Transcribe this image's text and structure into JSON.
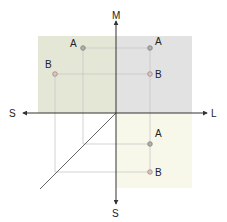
{
  "axes": {
    "up": "M",
    "left": "S",
    "right": "L",
    "down": "S"
  },
  "points": {
    "upper_left": {
      "a": "A",
      "b": "B"
    },
    "upper_right": {
      "a": "A",
      "b": "B"
    },
    "lower_right": {
      "a": "A",
      "b": "B"
    }
  },
  "colors": {
    "upper_left_fill": "#e5e7d6",
    "upper_right_fill": "#e1e2e1",
    "lower_right_fill": "#f7f8ea",
    "axis": "#333333",
    "projection_line": "#c8c8c8",
    "point_a": "#8d8d88",
    "point_b": "#c79a96"
  }
}
